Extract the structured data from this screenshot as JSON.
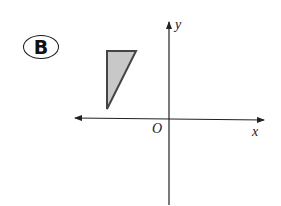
{
  "figure": {
    "badge_label": "B",
    "axes": {
      "x_label": "x",
      "y_label": "y",
      "origin_label": "O"
    },
    "shape": {
      "type": "right-triangle",
      "fill_color": "#c8c8c8",
      "stroke_color": "#444444",
      "quadrant": "II",
      "description": "Shaded right triangle with vertical left edge and horizontal top edge, located in the second quadrant above the x-axis and left of the y-axis"
    },
    "colors": {
      "axis": "#222222",
      "background": "#ffffff"
    }
  }
}
